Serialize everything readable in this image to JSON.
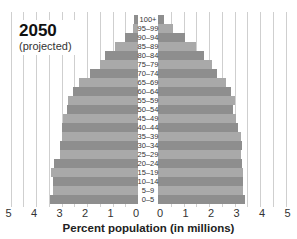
{
  "chart_data": {
    "type": "bar",
    "orientation": "horizontal-population-pyramid",
    "title": "2050",
    "subtitle": "(projected)",
    "xlabel": "Percent population (in millions)",
    "ylabel": "",
    "xlim": [
      0,
      5
    ],
    "x_ticks_left": [
      "5",
      "4",
      "3",
      "2",
      "1",
      "0"
    ],
    "x_ticks_right": [
      "0",
      "1",
      "2",
      "3",
      "4",
      "5"
    ],
    "categories": [
      "100+",
      "95–99",
      "90–94",
      "85–89",
      "80–84",
      "75–79",
      "70–74",
      "65–69",
      "60–64",
      "55–59",
      "50–54",
      "45–49",
      "40–44",
      "35–39",
      "30–34",
      "25–29",
      "20–24",
      "15–19",
      "10–14",
      "5–9",
      "0–5"
    ],
    "series": [
      {
        "name": "left",
        "side": "left",
        "values": [
          0.15,
          0.2,
          0.5,
          0.9,
          1.3,
          1.5,
          1.9,
          2.3,
          2.55,
          2.75,
          2.8,
          2.95,
          3.0,
          3.0,
          3.05,
          3.05,
          3.3,
          3.4,
          3.35,
          3.35,
          3.45
        ]
      },
      {
        "name": "right",
        "side": "right",
        "values": [
          0.25,
          0.6,
          1.05,
          1.5,
          1.8,
          2.1,
          2.3,
          2.65,
          2.85,
          3.0,
          2.95,
          3.05,
          3.15,
          3.25,
          3.3,
          3.25,
          3.3,
          3.35,
          3.35,
          3.35,
          3.4
        ]
      }
    ],
    "grid": true,
    "legend": null
  },
  "colors": {
    "bar_dark": "#8e8e8e",
    "bar_light": "#a9a9a9",
    "grid": "#cfcfcf",
    "text": "#222222"
  }
}
